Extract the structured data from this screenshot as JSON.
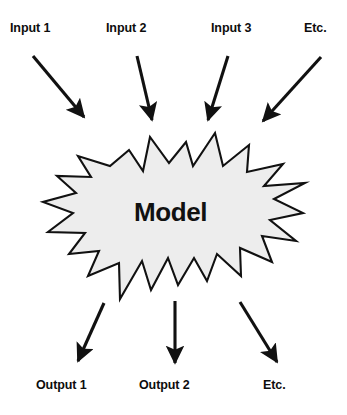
{
  "diagram": {
    "background_color": "#ffffff",
    "stroke_color": "#111111",
    "shape": {
      "name": "Model",
      "label": "Model",
      "kind": "starburst",
      "fill_color": "#ededed",
      "stroke_color": "#111111"
    },
    "inputs": [
      {
        "label": "Input 1"
      },
      {
        "label": "Input 2"
      },
      {
        "label": "Input 3"
      },
      {
        "label": "Etc."
      }
    ],
    "outputs": [
      {
        "label": "Output 1"
      },
      {
        "label": "Output 2"
      },
      {
        "label": "Etc."
      }
    ]
  }
}
